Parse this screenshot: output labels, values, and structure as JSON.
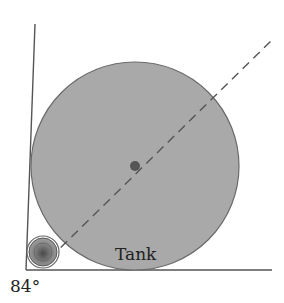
{
  "diagram": {
    "labels": {
      "tank": "Tank",
      "angle": "84°"
    },
    "colors": {
      "tank_fill": "#a9a9a9",
      "tank_stroke": "#6a6a6a",
      "line": "#555555",
      "center_dot": "#555555",
      "small_outer": "#8a8a8a",
      "small_inner": "#5a5a5a"
    },
    "geometry": {
      "corner": [
        26,
        270
      ],
      "vertical_top": [
        35,
        24
      ],
      "horizontal_end": [
        272,
        270
      ],
      "tank_center": [
        135,
        166
      ],
      "tank_radius": 104,
      "small_center": [
        43,
        252
      ],
      "small_radius": 15,
      "dashed_from": [
        50,
        258
      ],
      "dashed_to": [
        272,
        40
      ]
    }
  }
}
